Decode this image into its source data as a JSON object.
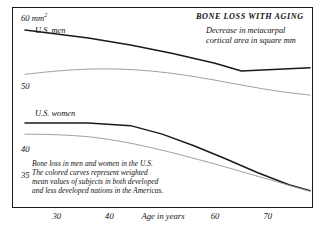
{
  "chart_data": {
    "type": "line",
    "title": "BONE LOSS WITH AGING",
    "subtitle_line1": "Decrease in metacarpal",
    "subtitle_line2": "cortical area in square mm",
    "xlabel": "Age in years",
    "ylabel": "60 mm",
    "ylabel_sup": "2",
    "xlim": [
      24,
      78
    ],
    "ylim": [
      33,
      61
    ],
    "grid": false,
    "legend": "inline-labels",
    "x_ticks": [
      30,
      40,
      60,
      70
    ],
    "x_tick_labels": [
      "30",
      "40",
      "60",
      "70"
    ],
    "y_ticks": [
      60,
      50,
      40,
      35
    ],
    "y_tick_labels": [
      "60 mm",
      "50",
      "40",
      "35"
    ],
    "series": [
      {
        "name": "U.S. men",
        "label": "U.S. men",
        "color": "#1a1a1a",
        "emphasis": "dark",
        "x": [
          24,
          36,
          44,
          52,
          60,
          65,
          70,
          78
        ],
        "values": [
          59.6,
          58.4,
          57.3,
          56.0,
          54.5,
          53.3,
          53.5,
          53.8
        ]
      },
      {
        "name": "men weighted Americas",
        "label": "",
        "color": "#8f8f8f",
        "emphasis": "light",
        "x": [
          24,
          30,
          36,
          42,
          48,
          54,
          60,
          66,
          72,
          78
        ],
        "values": [
          52.8,
          53.3,
          53.6,
          53.6,
          53.3,
          52.7,
          51.9,
          51.0,
          50.2,
          49.6
        ]
      },
      {
        "name": "U.S. women",
        "label": "U.S. women",
        "color": "#1a1a1a",
        "emphasis": "dark",
        "x": [
          24,
          36,
          44,
          50,
          56,
          62,
          68,
          74,
          78
        ],
        "values": [
          45.3,
          45.3,
          44.9,
          43.6,
          41.8,
          39.8,
          37.7,
          35.8,
          34.9
        ]
      },
      {
        "name": "women weighted Americas",
        "label": "",
        "color": "#8f8f8f",
        "emphasis": "light",
        "x": [
          24,
          30,
          36,
          42,
          48,
          54,
          60,
          66,
          72,
          78
        ],
        "values": [
          43.6,
          43.5,
          43.2,
          42.5,
          41.5,
          40.3,
          39.0,
          37.6,
          36.2,
          34.8
        ]
      }
    ],
    "annotation": {
      "line1": "Bone loss in men and women in the U.S.",
      "line2": "The colored curves represent weighted",
      "line3": "mean values of subjects in both developed",
      "line4": "and less developed nations in the Americas."
    },
    "colors": {
      "dark_curve": "#1a1a1a",
      "light_curve": "#8f8f8f",
      "frame": "#1a1a1a",
      "text": "#111111",
      "background": "#ffffff"
    }
  }
}
